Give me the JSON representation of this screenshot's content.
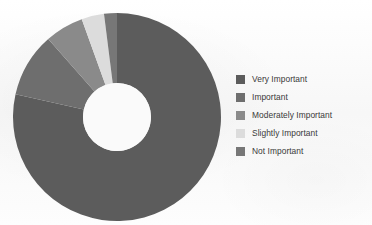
{
  "chart_data": {
    "type": "pie",
    "variant": "donut",
    "title": "",
    "subtitle": "",
    "xlabel": "",
    "ylabel": "",
    "grid": false,
    "legend_position": "right",
    "start_angle_deg": 0,
    "direction": "clockwise",
    "categories": [
      "Very Important",
      "Important",
      "Moderately Important",
      "Slightly Important",
      "Not Important"
    ],
    "values": [
      78.5,
      10.0,
      6.0,
      3.5,
      2.0
    ],
    "colors": [
      "#5c5c5c",
      "#6e6e6e",
      "#8a8a8a",
      "#dcdcdc",
      "#777777"
    ],
    "annotations": []
  },
  "legend": {
    "items": [
      {
        "label": "Very Important",
        "color": "#5c5c5c"
      },
      {
        "label": "Important",
        "color": "#6e6e6e"
      },
      {
        "label": "Moderately Important",
        "color": "#8a8a8a"
      },
      {
        "label": "Slightly Important",
        "color": "#dcdcdc"
      },
      {
        "label": "Not Important",
        "color": "#777777"
      }
    ]
  },
  "chart": {
    "center_x": 110,
    "center_y": 109,
    "outer_radius": 104,
    "inner_radius": 34,
    "hole_color": "#fafafa",
    "background": "#fbfbfb"
  }
}
